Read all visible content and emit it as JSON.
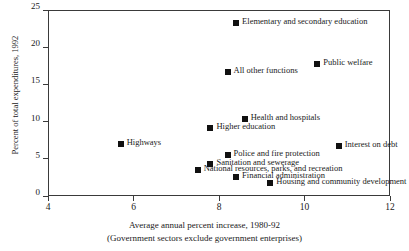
{
  "chart_data": {
    "type": "scatter",
    "title": "",
    "xlabel": "Average annual percent increase, 1980-92",
    "xlabel_note": "(Government sectors exclude government enterprises)",
    "ylabel": "Percent of total expenditures, 1992",
    "xlim": [
      4,
      12
    ],
    "ylim": [
      0,
      25
    ],
    "xticks": [
      4,
      6,
      8,
      10,
      12
    ],
    "yticks": [
      0,
      5,
      10,
      15,
      20,
      25
    ],
    "grid": false,
    "legend": "none",
    "marker_color": "#111111",
    "points": [
      {
        "label": "Elementary and secondary education",
        "x": 8.4,
        "y": 23.3,
        "label_side": "right"
      },
      {
        "label": "Public welfare",
        "x": 10.3,
        "y": 17.7,
        "label_side": "right"
      },
      {
        "label": "All other functions",
        "x": 8.2,
        "y": 16.6,
        "label_side": "right"
      },
      {
        "label": "Health and hospitals",
        "x": 8.6,
        "y": 10.3,
        "label_side": "right"
      },
      {
        "label": "Higher education",
        "x": 7.8,
        "y": 9.1,
        "label_side": "right"
      },
      {
        "label": "Highways",
        "x": 5.7,
        "y": 7.0,
        "label_side": "right"
      },
      {
        "label": "Interest on debt",
        "x": 10.8,
        "y": 6.7,
        "label_side": "right"
      },
      {
        "label": "Police and fire protection",
        "x": 8.2,
        "y": 5.5,
        "label_side": "right"
      },
      {
        "label": "Sanitation and sewerage",
        "x": 7.8,
        "y": 4.3,
        "label_side": "right"
      },
      {
        "label": "National resources, parks, and recreation",
        "x": 7.5,
        "y": 3.5,
        "label_side": "right"
      },
      {
        "label": "Financial administration",
        "x": 8.4,
        "y": 2.6,
        "label_side": "right"
      },
      {
        "label": "Housing and community development",
        "x": 9.2,
        "y": 1.8,
        "label_side": "right"
      }
    ]
  }
}
